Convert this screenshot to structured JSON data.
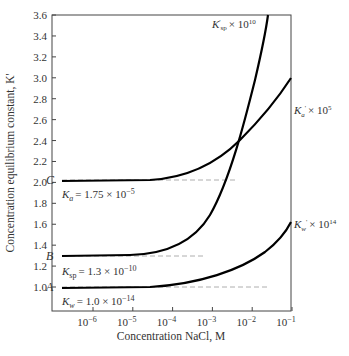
{
  "chart_data": {
    "type": "line",
    "title": "",
    "xlabel": "Concentration NaCl, M",
    "ylabel": "Concentration equilibrium constant, K'",
    "xscale": "log",
    "x_ticks": [
      "10^-6",
      "10^-5",
      "10^-4",
      "10^-3",
      "10^-2",
      "10^-1"
    ],
    "y_ticks": [
      "1.0",
      "1.2",
      "1.4",
      "1.6",
      "1.8",
      "2.0",
      "2.2",
      "2.4",
      "2.6",
      "2.8",
      "3.0",
      "3.2",
      "3.4",
      "3.6"
    ],
    "ylim": [
      0.9,
      3.6
    ],
    "xlim_log10": [
      -6.5,
      -1
    ],
    "grid": false,
    "series": [
      {
        "name": "K'_sp × 10^10",
        "point_label": "B",
        "baseline": "K_sp = 1.3 × 10^-10",
        "x_log10": [
          -6.5,
          -5,
          -4.5,
          -4,
          -3.5,
          -3,
          -2.5,
          -2,
          -1.6
        ],
        "values": [
          1.3,
          1.31,
          1.33,
          1.38,
          1.5,
          1.75,
          2.2,
          2.9,
          3.6
        ]
      },
      {
        "name": "K'_a × 10^5",
        "point_label": "C",
        "baseline": "K_a = 1.75 × 10^-5",
        "x_log10": [
          -6.5,
          -5,
          -4.5,
          -4,
          -3.5,
          -3,
          -2.5,
          -2,
          -1.5,
          -1
        ],
        "values": [
          1.75,
          1.75,
          1.76,
          1.79,
          1.84,
          1.92,
          2.05,
          2.22,
          2.42,
          2.65
        ]
      },
      {
        "name": "K'_w × 10^14",
        "point_label": "A",
        "baseline": "K_w = 1.0 × 10^-14",
        "x_log10": [
          -6.5,
          -5,
          -4.5,
          -4,
          -3.5,
          -3,
          -2.5,
          -2,
          -1.5,
          -1
        ],
        "values": [
          1.0,
          1.0,
          1.01,
          1.03,
          1.06,
          1.1,
          1.17,
          1.27,
          1.42,
          1.65
        ]
      }
    ],
    "annotations": [
      "A",
      "B",
      "C",
      "K_w = 1.0 × 10^-14",
      "K_sp = 1.3 × 10^-10",
      "K_a = 1.75 × 10^-5",
      "K'_sp × 10^10",
      "K'_a × 10^5",
      "K'_w × 10^14"
    ]
  },
  "labels": {
    "xlabel": "Concentration NaCl, M",
    "ylabel": "Concentration equilibrium constant, K'",
    "A": "A",
    "B": "B",
    "C": "C",
    "kw_eq": "= 1.0 × 10",
    "kw_exp": "−14",
    "ksp_eq": "= 1.3 × 10",
    "ksp_exp": "−10",
    "ka_eq": "= 1.75 × 10",
    "ka_exp": "−5",
    "ksp_curve": "× 10",
    "ksp_curve_exp": "10",
    "ka_curve": "× 10",
    "ka_curve_exp": "5",
    "kw_curve": "× 10",
    "kw_curve_exp": "14"
  }
}
